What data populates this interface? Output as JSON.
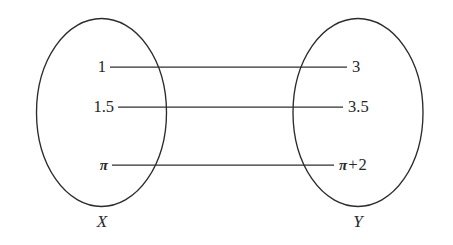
{
  "figure": {
    "type": "set-mapping-diagram",
    "stroke_color": "#2b2b2b",
    "background_color": "#ffffff",
    "domain": {
      "set_label": "X",
      "elements": [
        {
          "label": "1",
          "y": 67
        },
        {
          "label": "1.5",
          "y": 107
        },
        {
          "label": "π",
          "y": 165
        }
      ]
    },
    "codomain": {
      "set_label": "Y",
      "elements": [
        {
          "label": "3",
          "y": 67
        },
        {
          "label": "3.5",
          "y": 107
        },
        {
          "label": "π + 2",
          "pi": "π",
          "plus": "+",
          "addend": "2",
          "y": 165
        }
      ]
    },
    "mappings": [
      {
        "from": "1",
        "to": "3",
        "y": 67
      },
      {
        "from": "1.5",
        "to": "3.5",
        "y": 107
      },
      {
        "from": "π",
        "to": "π + 2",
        "y": 165
      }
    ]
  }
}
